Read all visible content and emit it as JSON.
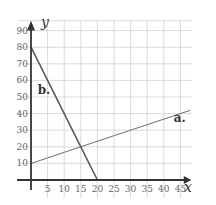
{
  "chart_data": {
    "type": "line",
    "title": "",
    "xlabel": "x",
    "ylabel": "y",
    "xlim": [
      0,
      48
    ],
    "ylim": [
      0,
      95
    ],
    "grid": true,
    "xticks": [
      5,
      10,
      15,
      20,
      25,
      30,
      35,
      40,
      45
    ],
    "yticks": [
      10,
      20,
      30,
      40,
      50,
      60,
      70,
      80,
      90
    ],
    "series": [
      {
        "name": "a.",
        "x": [
          0,
          15,
          48
        ],
        "values": [
          10,
          20,
          42
        ]
      },
      {
        "name": "b.",
        "x": [
          0,
          15,
          20
        ],
        "values": [
          80,
          20,
          0
        ]
      }
    ],
    "annotations": [
      {
        "text": "a.",
        "x": 43,
        "y": 35
      },
      {
        "text": "b.",
        "x": 2,
        "y": 52
      }
    ]
  }
}
